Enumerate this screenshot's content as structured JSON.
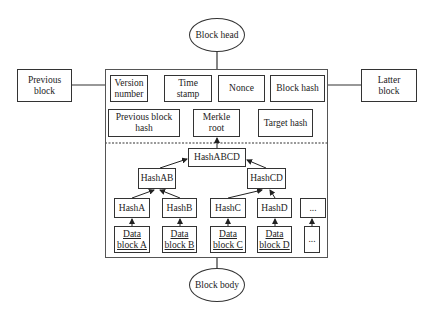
{
  "header": {
    "block_head": "Block head",
    "block_body": "Block body"
  },
  "neighbors": {
    "previous": "Previous block",
    "latter": "Latter block"
  },
  "head_fields": {
    "version": "Version number",
    "timestamp": "Time stamp",
    "nonce": "Nonce",
    "block_hash": "Block hash",
    "prev_hash": "Previous block hash",
    "merkle_root": "Merkle root",
    "target_hash": "Target hash"
  },
  "merkle": {
    "root": "HashABCD",
    "level1": [
      "HashAB",
      "HashCD"
    ],
    "leaves": [
      "HashA",
      "HashB",
      "HashC",
      "HashD",
      "..."
    ],
    "data": [
      "Data block A",
      "Data block B",
      "Data block C",
      "Data block D",
      "..."
    ]
  }
}
